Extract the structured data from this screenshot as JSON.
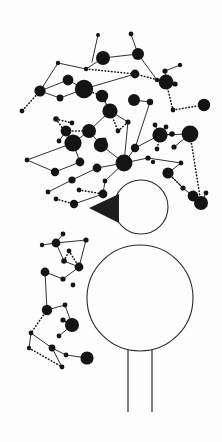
{
  "artwork": {
    "title": "Abstract node-network figure",
    "background_color": "#fdfdfd",
    "node_color": "#141414",
    "edge_color": "#1a1a1a",
    "outline_color": "#2b2b2b",
    "canvas": {
      "width": 222,
      "height": 442
    }
  },
  "figure": {
    "head": {
      "cx": 141,
      "cy": 207,
      "r": 27
    },
    "body": {
      "cx": 140,
      "cy": 298,
      "r": 53
    },
    "beak": {
      "points": "119,194 119,223 89,208"
    },
    "legs": [
      {
        "x1": 128,
        "y1": 350,
        "x2": 128,
        "y2": 412
      },
      {
        "x1": 152,
        "y1": 350,
        "x2": 152,
        "y2": 412
      }
    ]
  },
  "chart_data": {
    "type": "scatter",
    "xlabel": "",
    "ylabel": "",
    "xlim": [
      0,
      222
    ],
    "ylim": [
      0,
      442
    ],
    "grid": false,
    "legend": "none",
    "nodes": [
      {
        "x": 98,
        "y": 35,
        "r": 2.0
      },
      {
        "x": 131,
        "y": 34,
        "r": 2.4
      },
      {
        "x": 103,
        "y": 58,
        "r": 7.0
      },
      {
        "x": 138,
        "y": 54,
        "r": 6.0
      },
      {
        "x": 58,
        "y": 63,
        "r": 2.2
      },
      {
        "x": 86,
        "y": 69,
        "r": 2.2
      },
      {
        "x": 180,
        "y": 65,
        "r": 2.2
      },
      {
        "x": 165,
        "y": 71,
        "r": 2.6
      },
      {
        "x": 135,
        "y": 74,
        "r": 4.4
      },
      {
        "x": 68,
        "y": 80,
        "r": 5.4
      },
      {
        "x": 84,
        "y": 89,
        "r": 9.2
      },
      {
        "x": 157,
        "y": 80,
        "r": 2.2
      },
      {
        "x": 166,
        "y": 82,
        "r": 7.4
      },
      {
        "x": 175,
        "y": 84,
        "r": 2.6
      },
      {
        "x": 40,
        "y": 91,
        "r": 5.6
      },
      {
        "x": 60,
        "y": 98,
        "r": 3.4
      },
      {
        "x": 102,
        "y": 96,
        "r": 6.2
      },
      {
        "x": 134,
        "y": 100,
        "r": 6.0
      },
      {
        "x": 150,
        "y": 102,
        "r": 3.2
      },
      {
        "x": 22,
        "y": 111,
        "r": 2.4
      },
      {
        "x": 110,
        "y": 111,
        "r": 7.6
      },
      {
        "x": 173,
        "y": 110,
        "r": 2.4
      },
      {
        "x": 204,
        "y": 105,
        "r": 6.2
      },
      {
        "x": 56,
        "y": 119,
        "r": 2.8
      },
      {
        "x": 72,
        "y": 123,
        "r": 2.4
      },
      {
        "x": 128,
        "y": 122,
        "r": 2.6
      },
      {
        "x": 155,
        "y": 125,
        "r": 2.4
      },
      {
        "x": 66,
        "y": 131,
        "r": 5.4
      },
      {
        "x": 89,
        "y": 131,
        "r": 7.0
      },
      {
        "x": 166,
        "y": 127,
        "r": 2.4
      },
      {
        "x": 172,
        "y": 134,
        "r": 2.8
      },
      {
        "x": 59,
        "y": 141,
        "r": 2.4
      },
      {
        "x": 104,
        "y": 140,
        "r": 2.6
      },
      {
        "x": 118,
        "y": 131,
        "r": 2.4
      },
      {
        "x": 160,
        "y": 135,
        "r": 7.6
      },
      {
        "x": 190,
        "y": 134,
        "r": 8.4
      },
      {
        "x": 73,
        "y": 143,
        "r": 8.6
      },
      {
        "x": 101,
        "y": 145,
        "r": 7.2
      },
      {
        "x": 135,
        "y": 148,
        "r": 4.2
      },
      {
        "x": 157,
        "y": 149,
        "r": 2.4
      },
      {
        "x": 174,
        "y": 147,
        "r": 2.6
      },
      {
        "x": 27,
        "y": 160,
        "r": 2.4
      },
      {
        "x": 80,
        "y": 162,
        "r": 4.4
      },
      {
        "x": 124,
        "y": 163,
        "r": 8.4
      },
      {
        "x": 148,
        "y": 158,
        "r": 2.6
      },
      {
        "x": 55,
        "y": 172,
        "r": 4.2
      },
      {
        "x": 97,
        "y": 168,
        "r": 4.4
      },
      {
        "x": 153,
        "y": 162,
        "r": 2.2
      },
      {
        "x": 181,
        "y": 163,
        "r": 2.4
      },
      {
        "x": 72,
        "y": 180,
        "r": 3.6
      },
      {
        "x": 105,
        "y": 181,
        "r": 2.4
      },
      {
        "x": 168,
        "y": 173,
        "r": 5.6
      },
      {
        "x": 48,
        "y": 192,
        "r": 2.4
      },
      {
        "x": 79,
        "y": 190,
        "r": 2.4
      },
      {
        "x": 103,
        "y": 194,
        "r": 4.4
      },
      {
        "x": 183,
        "y": 188,
        "r": 2.6
      },
      {
        "x": 193,
        "y": 196,
        "r": 5.4
      },
      {
        "x": 56,
        "y": 199,
        "r": 2.4
      },
      {
        "x": 74,
        "y": 204,
        "r": 4.2
      },
      {
        "x": 206,
        "y": 193,
        "r": 2.4
      },
      {
        "x": 201,
        "y": 203,
        "r": 7.0
      },
      {
        "x": 63,
        "y": 234,
        "r": 2.4
      },
      {
        "x": 56,
        "y": 243,
        "r": 4.4
      },
      {
        "x": 42,
        "y": 245,
        "r": 2.2
      },
      {
        "x": 86,
        "y": 240,
        "r": 2.6
      },
      {
        "x": 64,
        "y": 261,
        "r": 2.8
      },
      {
        "x": 79,
        "y": 267,
        "r": 4.4
      },
      {
        "x": 69,
        "y": 251,
        "r": 2.4
      },
      {
        "x": 45,
        "y": 272,
        "r": 4.4
      },
      {
        "x": 63,
        "y": 279,
        "r": 2.6
      },
      {
        "x": 73,
        "y": 285,
        "r": 2.4
      },
      {
        "x": 65,
        "y": 305,
        "r": 2.4
      },
      {
        "x": 47,
        "y": 310,
        "r": 5.2
      },
      {
        "x": 63,
        "y": 320,
        "r": 2.6
      },
      {
        "x": 59,
        "y": 336,
        "r": 2.4
      },
      {
        "x": 31,
        "y": 333,
        "r": 2.4
      },
      {
        "x": 72,
        "y": 325,
        "r": 7.0
      },
      {
        "x": 29,
        "y": 348,
        "r": 2.2
      },
      {
        "x": 52,
        "y": 348,
        "r": 3.4
      },
      {
        "x": 66,
        "y": 355,
        "r": 2.4
      },
      {
        "x": 62,
        "y": 367,
        "r": 2.4
      },
      {
        "x": 87,
        "y": 358,
        "r": 6.6
      }
    ],
    "edges_solid": [
      [
        98,
        35,
        92,
        62
      ],
      [
        131,
        34,
        138,
        54
      ],
      [
        138,
        54,
        103,
        58
      ],
      [
        103,
        58,
        86,
        69
      ],
      [
        86,
        69,
        58,
        63
      ],
      [
        58,
        63,
        40,
        91
      ],
      [
        40,
        91,
        68,
        80
      ],
      [
        68,
        80,
        84,
        89
      ],
      [
        84,
        89,
        60,
        98
      ],
      [
        60,
        98,
        40,
        91
      ],
      [
        138,
        54,
        157,
        80
      ],
      [
        180,
        65,
        165,
        71
      ],
      [
        165,
        71,
        166,
        82
      ],
      [
        166,
        82,
        175,
        84
      ],
      [
        135,
        74,
        84,
        89
      ],
      [
        102,
        96,
        110,
        111
      ],
      [
        110,
        111,
        89,
        131
      ],
      [
        89,
        131,
        73,
        143
      ],
      [
        73,
        143,
        27,
        160
      ],
      [
        27,
        160,
        55,
        172
      ],
      [
        55,
        172,
        80,
        162
      ],
      [
        80,
        162,
        73,
        143
      ],
      [
        134,
        100,
        150,
        102
      ],
      [
        150,
        102,
        135,
        148
      ],
      [
        135,
        148,
        160,
        135
      ],
      [
        160,
        135,
        190,
        134
      ],
      [
        110,
        111,
        128,
        122
      ],
      [
        128,
        122,
        124,
        163
      ],
      [
        124,
        163,
        135,
        148
      ],
      [
        124,
        163,
        101,
        145
      ],
      [
        101,
        145,
        89,
        131
      ],
      [
        124,
        163,
        97,
        168
      ],
      [
        97,
        168,
        72,
        180
      ],
      [
        72,
        180,
        48,
        192
      ],
      [
        124,
        163,
        105,
        181
      ],
      [
        105,
        181,
        103,
        194
      ],
      [
        124,
        163,
        148,
        158
      ],
      [
        148,
        158,
        181,
        163
      ],
      [
        181,
        163,
        168,
        173
      ],
      [
        168,
        173,
        183,
        188
      ],
      [
        183,
        188,
        193,
        196
      ],
      [
        193,
        196,
        201,
        203
      ],
      [
        201,
        203,
        206,
        193
      ],
      [
        66,
        131,
        59,
        141
      ],
      [
        66,
        131,
        73,
        143
      ],
      [
        104,
        140,
        101,
        145
      ],
      [
        63,
        234,
        56,
        243
      ],
      [
        56,
        243,
        42,
        245
      ],
      [
        56,
        243,
        86,
        240
      ],
      [
        86,
        240,
        79,
        267
      ],
      [
        79,
        267,
        64,
        261
      ],
      [
        64,
        261,
        56,
        243
      ],
      [
        45,
        272,
        63,
        279
      ],
      [
        63,
        279,
        79,
        267
      ],
      [
        47,
        310,
        65,
        305
      ],
      [
        65,
        305,
        72,
        325
      ],
      [
        72,
        325,
        63,
        320
      ],
      [
        31,
        333,
        52,
        348
      ],
      [
        52,
        348,
        66,
        355
      ],
      [
        66,
        355,
        87,
        358
      ],
      [
        59,
        336,
        72,
        325
      ],
      [
        29,
        348,
        31,
        333
      ],
      [
        62,
        367,
        52,
        348
      ],
      [
        45,
        272,
        47,
        310
      ],
      [
        190,
        134,
        174,
        147
      ],
      [
        157,
        80,
        166,
        82
      ],
      [
        172,
        134,
        160,
        135
      ],
      [
        155,
        125,
        160,
        135
      ],
      [
        103,
        194,
        74,
        204
      ]
    ],
    "edges_dotted": [
      [
        40,
        91,
        22,
        111
      ],
      [
        86,
        69,
        135,
        74
      ],
      [
        135,
        74,
        166,
        82
      ],
      [
        84,
        89,
        102,
        96
      ],
      [
        102,
        96,
        110,
        111
      ],
      [
        110,
        111,
        118,
        131
      ],
      [
        118,
        131,
        128,
        122
      ],
      [
        166,
        82,
        173,
        110
      ],
      [
        173,
        110,
        204,
        105
      ],
      [
        89,
        131,
        66,
        131
      ],
      [
        73,
        143,
        56,
        119
      ],
      [
        160,
        135,
        157,
        149
      ],
      [
        168,
        173,
        183,
        188
      ],
      [
        79,
        190,
        103,
        194
      ],
      [
        56,
        199,
        74,
        204
      ],
      [
        64,
        261,
        69,
        251
      ],
      [
        69,
        251,
        79,
        267
      ],
      [
        47,
        310,
        31,
        333
      ],
      [
        29,
        348,
        62,
        367
      ],
      [
        63,
        320,
        72,
        325
      ],
      [
        56,
        119,
        72,
        123
      ],
      [
        190,
        134,
        201,
        203
      ]
    ]
  }
}
